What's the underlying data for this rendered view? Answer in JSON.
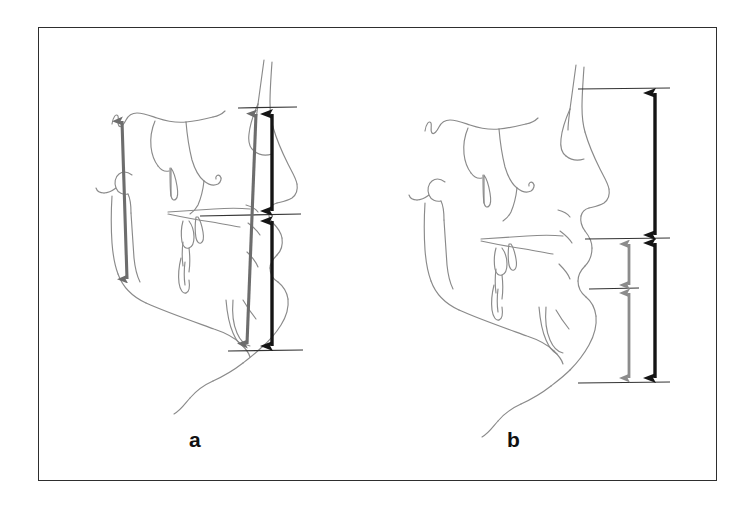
{
  "figure": {
    "kind": "cephalometric-tracing-figure",
    "background_color": "#ffffff",
    "frame": {
      "stroke_color": "#2e2e2e",
      "x": 38,
      "y": 27,
      "width": 679,
      "height": 454
    },
    "panels": [
      {
        "id": "a",
        "label": "a",
        "label_x": 189,
        "label_y": 428,
        "description": "Lateral cephalometric tracing with vertical facial height measurement arrows",
        "tracing_color": "#8a8a8a",
        "reference_lines": [
          {
            "name": "upper-reference-line",
            "y": 108,
            "x1": 238,
            "x2": 296,
            "color": "#333333"
          },
          {
            "name": "middle-reference-line",
            "y": 215,
            "x1": 200,
            "x2": 300,
            "color": "#333333"
          },
          {
            "name": "lower-reference-line",
            "y": 350,
            "x1": 228,
            "x2": 302,
            "color": "#333333"
          }
        ],
        "arrows": [
          {
            "name": "gray-posterior-height-arrow",
            "color": "#6d6d6d",
            "heads": "double",
            "x1": 127,
            "y1": 280,
            "x2": 123,
            "y2": 119
          },
          {
            "name": "gray-total-anterior-face-height-arrow",
            "color": "#6d6d6d",
            "heads": "double",
            "x1": 248,
            "y1": 345,
            "x2": 256,
            "y2": 112
          },
          {
            "name": "black-upper-anterior-face-height-arrow",
            "color": "#151515",
            "heads": "double",
            "x1": 272,
            "y1": 212,
            "x2": 272,
            "y2": 112
          },
          {
            "name": "black-lower-anterior-face-height-arrow",
            "color": "#151515",
            "heads": "double",
            "x1": 272,
            "y1": 347,
            "x2": 272,
            "y2": 220
          }
        ]
      },
      {
        "id": "b",
        "label": "b",
        "label_x": 507,
        "label_y": 428,
        "description": "Lateral cephalometric tracing with upper, lower and total face height measurement arrows",
        "tracing_color": "#8a8a8a",
        "reference_lines": [
          {
            "name": "upper-reference-line",
            "y": 89,
            "x1": 578,
            "x2": 668,
            "color": "#333333"
          },
          {
            "name": "palatal-reference-line",
            "y": 238,
            "x1": 585,
            "x2": 668,
            "color": "#333333"
          },
          {
            "name": "occlusal-reference-line",
            "y": 288,
            "x1": 589,
            "x2": 637,
            "color": "#333333"
          },
          {
            "name": "menton-reference-line",
            "y": 382,
            "x1": 578,
            "x2": 668,
            "color": "#333333"
          }
        ],
        "arrows": [
          {
            "name": "black-upper-face-height-arrow",
            "color": "#151515",
            "heads": "double",
            "x1": 655,
            "y1": 236,
            "x2": 655,
            "y2": 92
          },
          {
            "name": "black-lower-face-height-arrow",
            "color": "#151515",
            "heads": "double",
            "x1": 655,
            "y1": 379,
            "x2": 655,
            "y2": 241
          },
          {
            "name": "gray-upper-segment-arrow",
            "color": "#8c8c8c",
            "heads": "double",
            "x1": 629,
            "y1": 286,
            "x2": 629,
            "y2": 241
          },
          {
            "name": "gray-lower-segment-arrow",
            "color": "#8c8c8c",
            "heads": "double",
            "x1": 629,
            "y1": 379,
            "x2": 629,
            "y2": 291
          }
        ]
      }
    ]
  }
}
